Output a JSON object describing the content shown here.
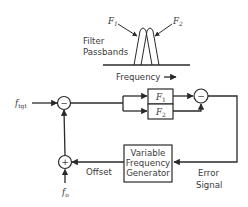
{
  "passband_plot": {
    "filter1_label": "F",
    "filter1_sub": "1",
    "filter2_label": "F",
    "filter2_sub": "2",
    "caption_line1": "Filter",
    "caption_line2": "Passbands",
    "axis_label": "Frequency",
    "axis_arrow": "→"
  },
  "block_diagram": {
    "input_label": "f",
    "input_sub": "tgt",
    "offset_input_label": "f",
    "offset_input_sub": "o",
    "sum_top_sign": "−",
    "sum_bottom_sign": "+",
    "diff_sign": "−",
    "filter1_block": "F",
    "filter1_block_sub": "1",
    "filter2_block": "F",
    "filter2_block_sub": "2",
    "vfg_line1": "Variable",
    "vfg_line2": "Frequency",
    "vfg_line3": "Generator",
    "offset_label": "Offset",
    "error_line1": "Error",
    "error_line2": "Signal"
  },
  "colors": {
    "stroke": "#2a2a2a",
    "text": "#3a3a3a",
    "background": "#ffffff"
  }
}
